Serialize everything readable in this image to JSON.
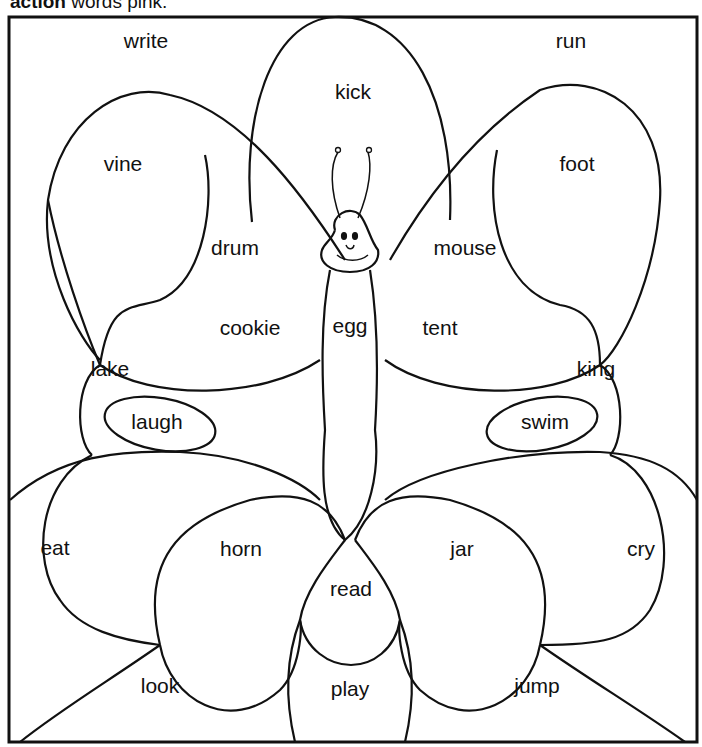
{
  "header": {
    "bold": "action",
    "rest": " words pink."
  },
  "words": [
    {
      "text": "write",
      "x": 146,
      "y": 41
    },
    {
      "text": "run",
      "x": 571,
      "y": 41
    },
    {
      "text": "kick",
      "x": 353,
      "y": 92
    },
    {
      "text": "vine",
      "x": 123,
      "y": 164
    },
    {
      "text": "foot",
      "x": 577,
      "y": 164
    },
    {
      "text": "drum",
      "x": 235,
      "y": 248
    },
    {
      "text": "mouse",
      "x": 465,
      "y": 248
    },
    {
      "text": "cookie",
      "x": 250,
      "y": 328
    },
    {
      "text": "egg",
      "x": 350,
      "y": 326
    },
    {
      "text": "tent",
      "x": 440,
      "y": 328
    },
    {
      "text": "lake",
      "x": 110,
      "y": 369
    },
    {
      "text": "king",
      "x": 596,
      "y": 369
    },
    {
      "text": "laugh",
      "x": 157,
      "y": 422
    },
    {
      "text": "swim",
      "x": 545,
      "y": 422
    },
    {
      "text": "eat",
      "x": 55,
      "y": 548
    },
    {
      "text": "horn",
      "x": 241,
      "y": 549
    },
    {
      "text": "jar",
      "x": 462,
      "y": 549
    },
    {
      "text": "cry",
      "x": 641,
      "y": 549
    },
    {
      "text": "read",
      "x": 351,
      "y": 589
    },
    {
      "text": "look",
      "x": 160,
      "y": 686
    },
    {
      "text": "play",
      "x": 350,
      "y": 689
    },
    {
      "text": "jump",
      "x": 537,
      "y": 686
    }
  ]
}
